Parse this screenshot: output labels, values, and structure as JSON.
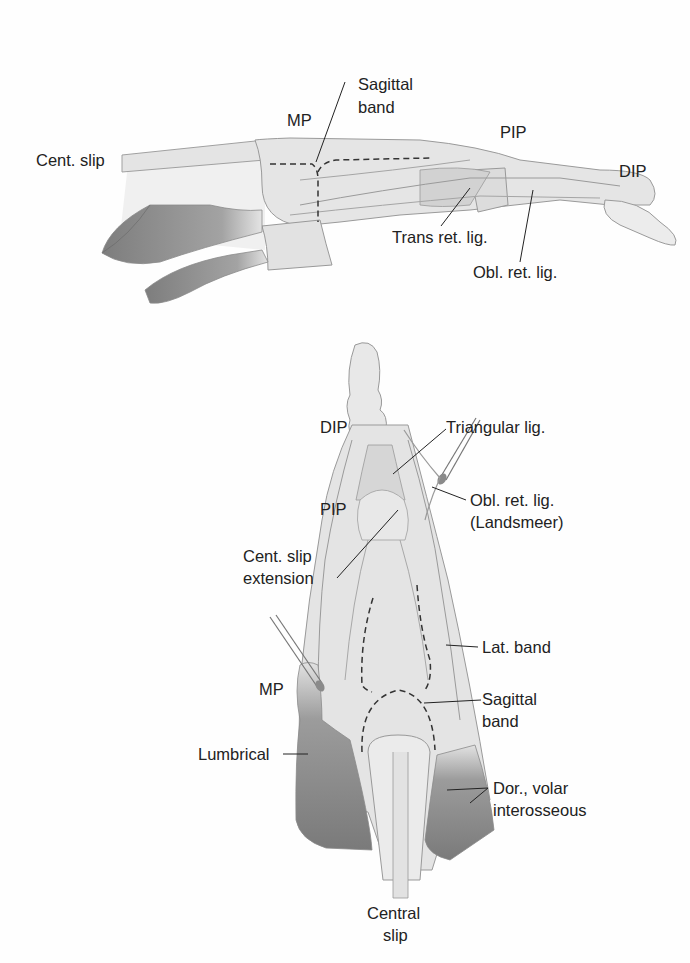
{
  "figure": {
    "lateral_view": {
      "labels": {
        "cent_slip": "Cent. slip",
        "mp": "MP",
        "sagittal_band_1": "Sagittal",
        "sagittal_band_2": "band",
        "pip": "PIP",
        "dip": "DIP",
        "trans_ret_lig": "Trans ret. lig.",
        "obl_ret_lig": "Obl. ret. lig."
      }
    },
    "dorsal_view": {
      "labels": {
        "dip": "DIP",
        "triangular_lig": "Triangular lig.",
        "pip": "PIP",
        "obl_ret_lig_1": "Obl. ret. lig.",
        "obl_ret_lig_2": "(Landsmeer)",
        "cent_slip_ext_1": "Cent. slip",
        "cent_slip_ext_2": "extension",
        "lat_band": "Lat. band",
        "mp": "MP",
        "sagittal_band_1": "Sagittal",
        "sagittal_band_2": "band",
        "lumbrical": "Lumbrical",
        "interosseous_1": "Dor., volar",
        "interosseous_2": "interosseous",
        "central_slip_1": "Central",
        "central_slip_2": "slip"
      }
    },
    "colors": {
      "tendon": "#e6e6e6",
      "tendon_edge": "#9a9a9a",
      "muscle": "#8a8a8a",
      "text": "#222222"
    }
  }
}
